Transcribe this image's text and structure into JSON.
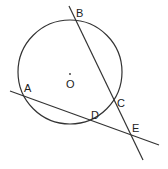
{
  "diagram": {
    "type": "geometry",
    "circle": {
      "center_label": "O",
      "cx": 70,
      "cy": 72,
      "r": 52
    },
    "points": [
      {
        "label": "A",
        "x": 22,
        "y": 95
      },
      {
        "label": "B",
        "x": 76,
        "y": 22
      },
      {
        "label": "C",
        "x": 115,
        "y": 102
      },
      {
        "label": "D",
        "x": 95,
        "y": 122
      },
      {
        "label": "E",
        "x": 131,
        "y": 134
      },
      {
        "label": "O",
        "x": 70,
        "y": 72
      }
    ],
    "lines": [
      {
        "name": "secant-BE",
        "through": [
          "B",
          "C",
          "E"
        ]
      },
      {
        "name": "secant-AE",
        "through": [
          "A",
          "D",
          "E"
        ]
      }
    ],
    "labels": {
      "A": "A",
      "B": "B",
      "C": "C",
      "D": "D",
      "E": "E",
      "O": "O"
    },
    "stroke_color": "#333333"
  }
}
